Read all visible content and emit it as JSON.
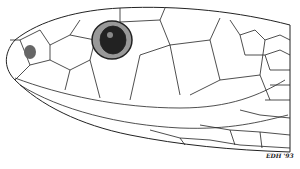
{
  "illustration": {
    "subject": "snake head line drawing (lateral view)",
    "signature": "EDH '93"
  }
}
